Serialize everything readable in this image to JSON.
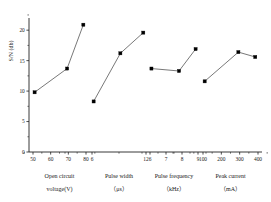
{
  "chart_data": {
    "type": "line",
    "title": "",
    "subtitle": "",
    "xlabel": "",
    "ylabel": "S/N (db)",
    "ylim": [
      0,
      22
    ],
    "yticks": [
      0,
      5,
      10,
      15,
      20
    ],
    "ytick_labels": [
      "0",
      "5",
      "10",
      "15",
      "20"
    ],
    "grid": false,
    "legend": "none",
    "marker": "filled-square",
    "groups": [
      {
        "name": "Open circuit voltage(V)",
        "caption_line1": "Open circuit",
        "caption_line2": "voltage(V)",
        "units": "V",
        "xtick_labels": [
          "50",
          "60",
          "70",
          "80"
        ],
        "x": [
          50,
          70,
          80
        ],
        "values": [
          9.8,
          13.7,
          20.9
        ]
      },
      {
        "name": "Pulse width (μs)",
        "caption_line1": "Pulse width",
        "caption_line2": "（μs）",
        "units": "μs",
        "xtick_labels": [
          "6",
          "12"
        ],
        "x": [
          3,
          10,
          16
        ],
        "values": [
          8.3,
          16.2,
          19.6
        ]
      },
      {
        "name": "Pulse frequency (kHz)",
        "caption_line1": "Pulse frequency",
        "caption_line2": "（kHz）",
        "units": "kHz",
        "xtick_labels": [
          "6",
          "7",
          "8",
          "9"
        ],
        "x": [
          6,
          8,
          9.2
        ],
        "values": [
          13.7,
          13.3,
          16.9
        ]
      },
      {
        "name": "Peak current (mA)",
        "caption_line1": "Peak current",
        "caption_line2": "（mA）",
        "units": "mA",
        "xtick_labels": [
          "100",
          "200",
          "300",
          "400"
        ],
        "x": [
          130,
          330,
          430
        ],
        "values": [
          11.6,
          16.4,
          15.6
        ]
      }
    ],
    "series": [
      {
        "name": "Open circuit voltage(V)",
        "categories": [
          "50",
          "70",
          "80"
        ],
        "values": [
          9.8,
          13.7,
          20.9
        ]
      },
      {
        "name": "Pulse width (μs)",
        "categories": [
          "4",
          "11",
          "17"
        ],
        "values": [
          8.3,
          16.2,
          19.6
        ]
      },
      {
        "name": "Pulse frequency (kHz)",
        "categories": [
          "6",
          "8",
          "9"
        ],
        "values": [
          13.7,
          13.3,
          16.9
        ]
      },
      {
        "name": "Peak current (mA)",
        "categories": [
          "130",
          "330",
          "430"
        ],
        "values": [
          11.6,
          16.4,
          15.6
        ]
      }
    ]
  },
  "axis": {
    "y_label": "S/N (db)"
  },
  "colors": {
    "marker": "#000000",
    "line": "#555555",
    "axis": "#222222",
    "background": "#ffffff"
  }
}
